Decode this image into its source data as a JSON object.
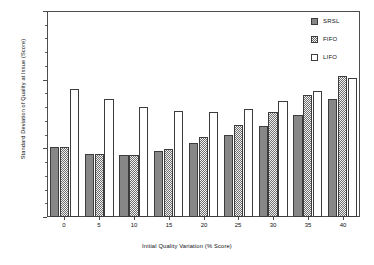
{
  "chart_data": {
    "type": "bar",
    "title": "",
    "xlabel": "Initial Quality Variation (% Score)",
    "ylabel": "Standard Deviation of Quality at Issue (Score)",
    "categories": [
      "0",
      "5",
      "10",
      "15",
      "20",
      "25",
      "30",
      "35",
      "40"
    ],
    "series": [
      {
        "name": "SRSL",
        "values": [
          5.1,
          4.6,
          4.5,
          4.8,
          5.4,
          5.95,
          6.65,
          7.4,
          8.6
        ]
      },
      {
        "name": "FIFO",
        "values": [
          5.1,
          4.6,
          4.55,
          4.95,
          5.8,
          6.7,
          7.65,
          8.85,
          10.3
        ]
      },
      {
        "name": "LIFO",
        "values": [
          9.35,
          8.6,
          8.0,
          7.7,
          7.65,
          7.85,
          8.45,
          9.15,
          10.15
        ]
      }
    ],
    "ylim": [
      0,
      15
    ],
    "y_ticks": [
      "0",
      "5",
      "10",
      "15"
    ],
    "y_tick_values": [
      0,
      5,
      10,
      15
    ],
    "y_minor_interval": 1,
    "x_ticks": [
      "0",
      "5",
      "10",
      "15",
      "20",
      "25",
      "30",
      "35",
      "40"
    ],
    "grid": false,
    "legend_position": "top-right",
    "colors": {
      "srsl": "#878787",
      "fifo": "#6f6f6f",
      "lifo": "#ffffff",
      "outline": "#3c3c3c",
      "axis": "#4d4d4d",
      "text": "#111111",
      "background": "#ffffff"
    }
  },
  "legend": {
    "entries": [
      {
        "label": "SRSL",
        "pattern": "solid-gray"
      },
      {
        "label": "FIFO",
        "pattern": "checkered"
      },
      {
        "label": "LIFO",
        "pattern": "outlined-white"
      }
    ]
  }
}
